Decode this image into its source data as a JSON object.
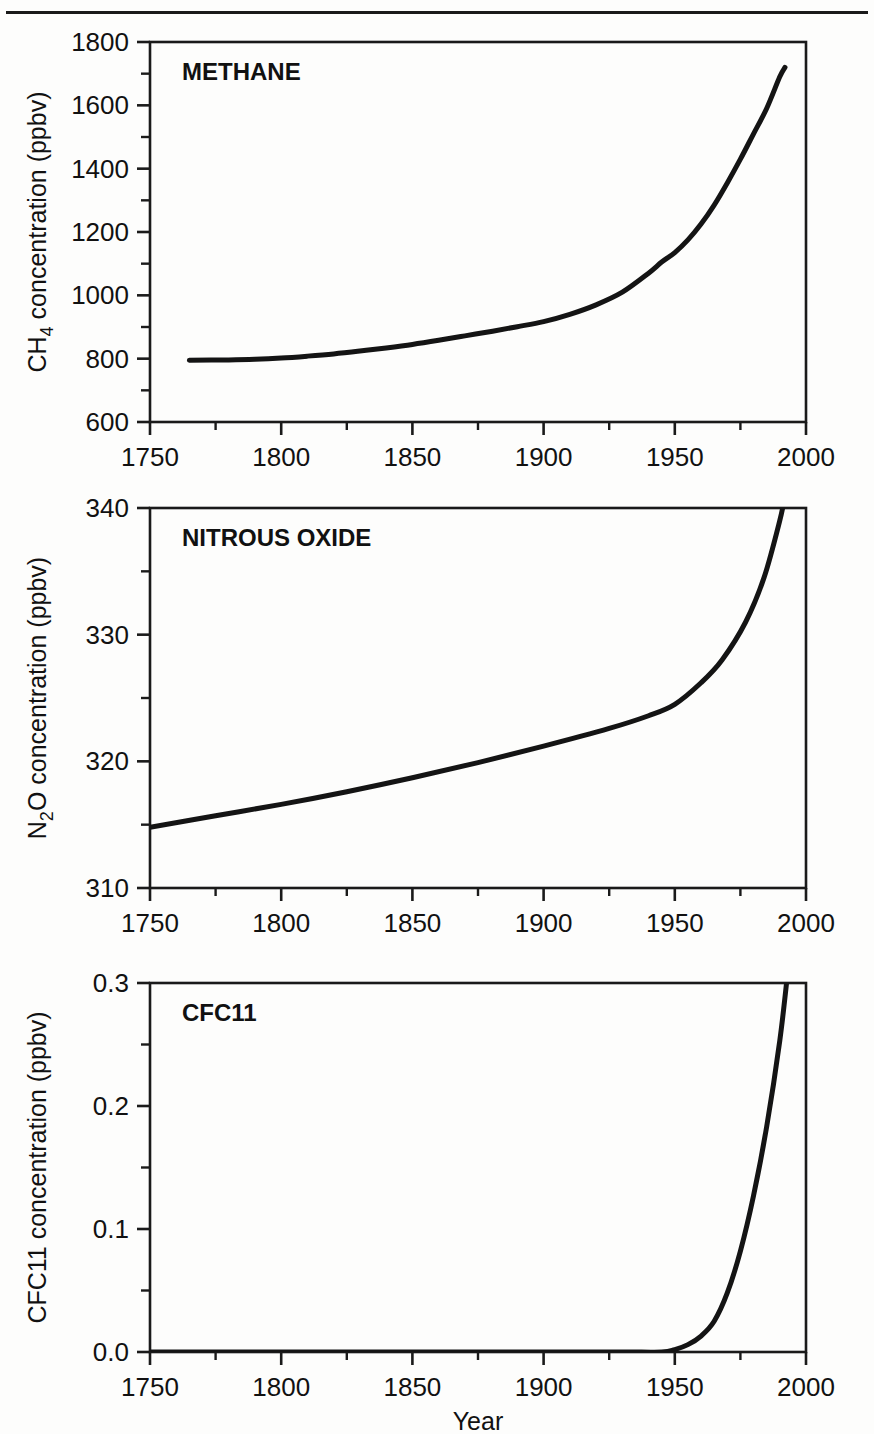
{
  "figure": {
    "background_color": "#fdfdfc",
    "line_color": "#141414",
    "axis_color": "#1a1a1a",
    "shared_xlabel": "Year",
    "xticks": [
      1750,
      1800,
      1850,
      1900,
      1950,
      2000
    ],
    "xtick_labels": [
      "1750",
      "1800",
      "1850",
      "1900",
      "1950",
      "2000"
    ],
    "xlim": [
      1750,
      2000
    ],
    "minor_xticks": [
      1775,
      1825,
      1875,
      1925,
      1975
    ]
  },
  "chart_data": [
    {
      "type": "line",
      "panel_index": 0,
      "title": "METHANE",
      "xlabel": "Year",
      "ylabel": "CH4 concentration (ppbv)",
      "ylabel_parts": {
        "pre": "CH",
        "sub": "4",
        "post": " concentration (ppbv)"
      },
      "xlim": [
        1750,
        2000
      ],
      "ylim": [
        600,
        1800
      ],
      "yticks": [
        600,
        800,
        1000,
        1200,
        1400,
        1600,
        1800
      ],
      "ytick_labels": [
        "600",
        "800",
        "1000",
        "1200",
        "1400",
        "1600",
        "1800"
      ],
      "minor_yticks": [
        700,
        900,
        1100,
        1300,
        1500,
        1700
      ],
      "grid": false,
      "legend": "none",
      "x": [
        1765,
        1780,
        1790,
        1800,
        1810,
        1820,
        1830,
        1840,
        1850,
        1860,
        1870,
        1880,
        1890,
        1900,
        1910,
        1920,
        1930,
        1940,
        1945,
        1950,
        1955,
        1960,
        1965,
        1970,
        1975,
        1980,
        1985,
        1990,
        1992
      ],
      "values": [
        795,
        796,
        798,
        802,
        808,
        815,
        824,
        834,
        845,
        858,
        872,
        886,
        901,
        917,
        940,
        970,
        1010,
        1070,
        1105,
        1135,
        1175,
        1225,
        1285,
        1355,
        1430,
        1510,
        1590,
        1690,
        1720
      ]
    },
    {
      "type": "line",
      "panel_index": 1,
      "title": "NITROUS OXIDE",
      "xlabel": "Year",
      "ylabel": "N2O concentration (ppbv)",
      "ylabel_parts": {
        "pre": "N",
        "sub": "2",
        "post": "O concentration (ppbv)"
      },
      "xlim": [
        1750,
        2000
      ],
      "ylim": [
        310,
        340
      ],
      "yticks": [
        310,
        320,
        330,
        340
      ],
      "ytick_labels": [
        "310",
        "320",
        "330",
        "340"
      ],
      "minor_yticks": [
        315,
        325,
        335
      ],
      "grid": false,
      "legend": "none",
      "x": [
        1750,
        1775,
        1800,
        1825,
        1850,
        1875,
        1900,
        1925,
        1940,
        1950,
        1960,
        1968,
        1977,
        1984,
        1990,
        1992
      ],
      "values": [
        314.8,
        315.7,
        316.6,
        317.6,
        318.7,
        319.9,
        321.2,
        322.6,
        323.6,
        324.5,
        326.2,
        328.0,
        331.0,
        334.5,
        339.0,
        341.0
      ]
    },
    {
      "type": "line",
      "panel_index": 2,
      "title": "CFC11",
      "xlabel": "Year",
      "ylabel": "CFC11 concentration (ppbv)",
      "ylabel_parts": {
        "pre": "CFC11 concentration (ppbv)",
        "sub": "",
        "post": ""
      },
      "xlim": [
        1750,
        2000
      ],
      "ylim": [
        0.0,
        0.3
      ],
      "yticks": [
        0.0,
        0.1,
        0.2,
        0.3
      ],
      "ytick_labels": [
        "0.0",
        "0.1",
        "0.2",
        "0.3"
      ],
      "minor_yticks": [
        0.05,
        0.15,
        0.25
      ],
      "grid": false,
      "legend": "none",
      "x": [
        1750,
        1850,
        1900,
        1930,
        1945,
        1950,
        1955,
        1960,
        1965,
        1970,
        1975,
        1980,
        1985,
        1990,
        1993
      ],
      "values": [
        0.0,
        0.0,
        0.0,
        0.0,
        0.0,
        0.002,
        0.006,
        0.013,
        0.025,
        0.048,
        0.082,
        0.127,
        0.183,
        0.253,
        0.308
      ]
    }
  ]
}
